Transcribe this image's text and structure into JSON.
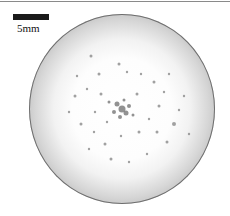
{
  "figure": {
    "scale_bar": {
      "label": "5mm",
      "color": "#1a1a1a"
    },
    "specimen": {
      "shape": "circle",
      "center_color": "#ffffff",
      "edge_color": "#6e6e6e",
      "description": "circular specimen with dark speckles concentrated near center"
    },
    "speckles": [
      {
        "x": 93,
        "y": 95,
        "r": 3.5
      },
      {
        "x": 88,
        "y": 90,
        "r": 2.5
      },
      {
        "x": 97,
        "y": 99,
        "r": 2.5
      },
      {
        "x": 85,
        "y": 98,
        "r": 2
      },
      {
        "x": 100,
        "y": 92,
        "r": 2
      },
      {
        "x": 91,
        "y": 103,
        "r": 2
      },
      {
        "x": 80,
        "y": 88,
        "r": 1.5
      },
      {
        "x": 104,
        "y": 101,
        "r": 1.5
      },
      {
        "x": 95,
        "y": 86,
        "r": 1.5
      },
      {
        "x": 62,
        "y": 42,
        "r": 1.5
      },
      {
        "x": 90,
        "y": 50,
        "r": 1.5
      },
      {
        "x": 98,
        "y": 58,
        "r": 1.2
      },
      {
        "x": 70,
        "y": 60,
        "r": 1.5
      },
      {
        "x": 58,
        "y": 75,
        "r": 1.2
      },
      {
        "x": 46,
        "y": 82,
        "r": 1.5
      },
      {
        "x": 40,
        "y": 98,
        "r": 1.2
      },
      {
        "x": 52,
        "y": 110,
        "r": 1.5
      },
      {
        "x": 65,
        "y": 118,
        "r": 1.2
      },
      {
        "x": 76,
        "y": 130,
        "r": 1.5
      },
      {
        "x": 92,
        "y": 122,
        "r": 1.2
      },
      {
        "x": 110,
        "y": 118,
        "r": 1.5
      },
      {
        "x": 120,
        "y": 105,
        "r": 1.2
      },
      {
        "x": 130,
        "y": 92,
        "r": 1.5
      },
      {
        "x": 135,
        "y": 78,
        "r": 1.2
      },
      {
        "x": 125,
        "y": 68,
        "r": 1.5
      },
      {
        "x": 112,
        "y": 60,
        "r": 1.2
      },
      {
        "x": 145,
        "y": 110,
        "r": 2
      },
      {
        "x": 150,
        "y": 96,
        "r": 1.2
      },
      {
        "x": 138,
        "y": 128,
        "r": 1.5
      },
      {
        "x": 118,
        "y": 140,
        "r": 1.2
      },
      {
        "x": 100,
        "y": 148,
        "r": 1.2
      },
      {
        "x": 82,
        "y": 145,
        "r": 1.5
      },
      {
        "x": 60,
        "y": 135,
        "r": 1.2
      },
      {
        "x": 155,
        "y": 82,
        "r": 1.2
      },
      {
        "x": 72,
        "y": 80,
        "r": 1.5
      },
      {
        "x": 108,
        "y": 80,
        "r": 1.5
      },
      {
        "x": 78,
        "y": 108,
        "r": 1.2
      },
      {
        "x": 128,
        "y": 118,
        "r": 1.5
      },
      {
        "x": 48,
        "y": 62,
        "r": 1.2
      },
      {
        "x": 160,
        "y": 120,
        "r": 1.2
      },
      {
        "x": 140,
        "y": 60,
        "r": 1.2
      },
      {
        "x": 66,
        "y": 98,
        "r": 1.2
      }
    ]
  }
}
